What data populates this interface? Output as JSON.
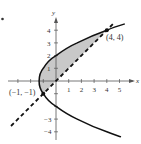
{
  "figure": {
    "bullet": "•",
    "axes": {
      "x_label": "x",
      "y_label": "y",
      "x_ticks": [
        "1",
        "2",
        "3",
        "4",
        "5"
      ],
      "y_ticks_pos": [
        "1",
        "2",
        "3",
        "4"
      ],
      "y_ticks_neg": [
        "−3",
        "−4"
      ]
    },
    "curves": {
      "parabola": "3x = y² − 4",
      "line": "y = x (dashed)"
    },
    "points": [
      {
        "label": "(−1, −1)",
        "x": -1,
        "y": -1
      },
      {
        "label": "(4, 4)",
        "x": 4,
        "y": 4
      }
    ],
    "colors": {
      "curve": "#111111",
      "shade": "#c8c8c8",
      "axis": "#555555"
    }
  }
}
